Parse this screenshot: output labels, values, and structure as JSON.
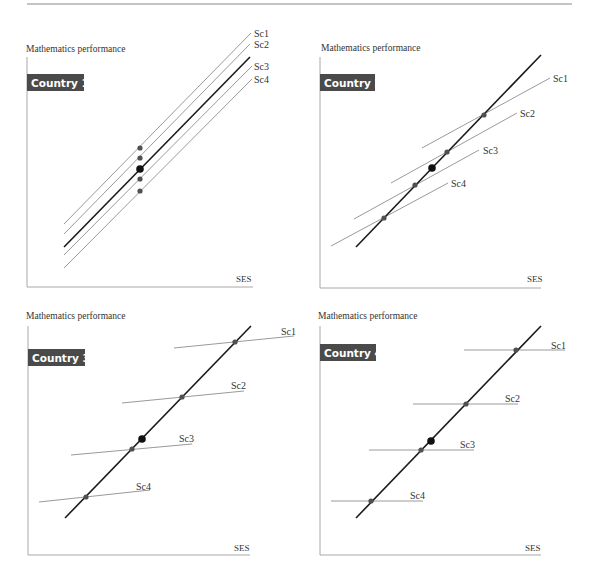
{
  "figure": {
    "top_rule": {
      "x1": 27,
      "x2": 572,
      "y": 4
    },
    "colors": {
      "axis": "#a8a8a8",
      "thin_line": "#9a9a9a",
      "thick_line": "#1a1a1a",
      "dot_small": "#505050",
      "dot_large": "#111111",
      "badge_bg": "#4a4a4a",
      "badge_text": "#ffffff"
    }
  },
  "chart_data": [
    {
      "type": "line",
      "title": "Country 1",
      "ylabel": "Mathematics performance",
      "xlabel": "SES",
      "legend": [
        "Sc1",
        "Sc2",
        "Sc3",
        "Sc4"
      ],
      "description": "Four parallel school lines, all with the same slope as the overall country gradient; school means differ only in level.",
      "series": [
        {
          "name": "Sc1",
          "slope_rel": "equal",
          "x": [
            64,
            251
          ],
          "y": [
            224,
            33
          ]
        },
        {
          "name": "Sc2",
          "slope_rel": "equal",
          "x": [
            64,
            250
          ],
          "y": [
            234,
            44
          ]
        },
        {
          "name": "Overall",
          "slope_rel": "equal",
          "x": [
            64,
            250
          ],
          "y": [
            247,
            57
          ]
        },
        {
          "name": "Sc3",
          "slope_rel": "equal",
          "x": [
            64,
            252
          ],
          "y": [
            255,
            66
          ]
        },
        {
          "name": "Sc4",
          "slope_rel": "equal",
          "x": [
            64,
            252
          ],
          "y": [
            268,
            79
          ]
        }
      ]
    },
    {
      "type": "line",
      "title": "Country 2",
      "ylabel": "Mathematics performance",
      "xlabel": "SES",
      "legend": [
        "Sc1",
        "Sc2",
        "Sc3",
        "Sc4"
      ],
      "description": "School lines have moderately shallower slopes than the steep overall gradient.",
      "series": [
        {
          "name": "Overall",
          "x": [
            356,
            541
          ],
          "y": [
            247,
            55
          ]
        },
        {
          "name": "Sc1",
          "x": [
            422,
            550
          ],
          "y": [
            148,
            78
          ]
        },
        {
          "name": "Sc2",
          "x": [
            391,
            517
          ],
          "y": [
            183,
            113
          ]
        },
        {
          "name": "Sc3",
          "x": [
            354,
            479
          ],
          "y": [
            219,
            150
          ]
        },
        {
          "name": "Sc4",
          "x": [
            331,
            448
          ],
          "y": [
            246,
            183
          ]
        }
      ]
    },
    {
      "type": "line",
      "title": "Country 3",
      "ylabel": "Mathematics performance",
      "xlabel": "SES",
      "legend": [
        "Sc1",
        "Sc2",
        "Sc3",
        "Sc4"
      ],
      "description": "School lines are nearly flat; between-school gradient is steep.",
      "series": [
        {
          "name": "Overall",
          "x": [
            65,
            251
          ],
          "y": [
            518,
            326
          ]
        },
        {
          "name": "Sc1",
          "x": [
            174,
            294
          ],
          "y": [
            348,
            336
          ]
        },
        {
          "name": "Sc2",
          "x": [
            122,
            244
          ],
          "y": [
            403,
            391
          ]
        },
        {
          "name": "Sc3",
          "x": [
            71,
            192
          ],
          "y": [
            455,
            444
          ]
        },
        {
          "name": "Sc4",
          "x": [
            39,
            150
          ],
          "y": [
            502,
            490
          ]
        }
      ]
    },
    {
      "type": "line",
      "title": "Country 4",
      "ylabel": "Mathematics performance",
      "xlabel": "SES",
      "legend": [
        "Sc1",
        "Sc2",
        "Sc3",
        "Sc4"
      ],
      "description": "School lines are completely flat (zero within-school gradient).",
      "series": [
        {
          "name": "Overall",
          "x": [
            356,
            541
          ],
          "y": [
            518,
            326
          ]
        },
        {
          "name": "Sc1",
          "x": [
            464,
            565
          ],
          "y": [
            350,
            350
          ]
        },
        {
          "name": "Sc2",
          "x": [
            413,
            518
          ],
          "y": [
            404,
            404
          ]
        },
        {
          "name": "Sc3",
          "x": [
            369,
            474
          ],
          "y": [
            450,
            450
          ]
        },
        {
          "name": "Sc4",
          "x": [
            331,
            423
          ],
          "y": [
            501,
            501
          ]
        }
      ]
    }
  ],
  "panels": [
    {
      "id": "country-1",
      "title": "Country 1",
      "ylabel": "Mathematics performance",
      "xlabel": "SES",
      "ylabel_pos": [
        26,
        52
      ],
      "axis": {
        "x0": 27,
        "ytop": 57,
        "ybottom": 287,
        "xright": 253
      },
      "xlabel_pos": [
        236,
        282
      ],
      "badge": {
        "x": 27,
        "y": 74,
        "w": 57,
        "h": 17
      },
      "thick": {
        "x1": 64,
        "y1": 247,
        "x2": 250,
        "y2": 57
      },
      "lines": [
        {
          "label": "Sc1",
          "x1": 64,
          "y1": 224,
          "x2": 251,
          "y2": 33,
          "lx": 254,
          "ly": 37
        },
        {
          "label": "Sc2",
          "x1": 64,
          "y1": 234,
          "x2": 250,
          "y2": 44,
          "lx": 254,
          "ly": 48
        },
        {
          "label": "Sc3",
          "x1": 64,
          "y1": 255,
          "x2": 252,
          "y2": 66,
          "lx": 254,
          "ly": 70
        },
        {
          "label": "Sc4",
          "x1": 64,
          "y1": 268,
          "x2": 252,
          "y2": 79,
          "lx": 254,
          "ly": 83
        }
      ],
      "dots": [
        {
          "x": 140,
          "y": 148
        },
        {
          "x": 140,
          "y": 158
        },
        {
          "x": 140,
          "y": 179
        },
        {
          "x": 140,
          "y": 191
        }
      ],
      "big_dot": {
        "x": 140,
        "y": 169
      }
    },
    {
      "id": "country-2",
      "title": "Country 2",
      "ylabel": "Mathematics performance",
      "xlabel": "SES",
      "ylabel_pos": [
        321,
        51
      ],
      "axis": {
        "x0": 320,
        "ytop": 57,
        "ybottom": 288,
        "xright": 541
      },
      "xlabel_pos": [
        527,
        282
      ],
      "badge": {
        "x": 320,
        "y": 74,
        "w": 55,
        "h": 17
      },
      "thick": {
        "x1": 356,
        "y1": 247,
        "x2": 541,
        "y2": 55
      },
      "lines": [
        {
          "label": "Sc1",
          "x1": 422,
          "y1": 148,
          "x2": 550,
          "y2": 78,
          "lx": 553,
          "ly": 82
        },
        {
          "label": "Sc2",
          "x1": 391,
          "y1": 183,
          "x2": 517,
          "y2": 113,
          "lx": 520,
          "ly": 117
        },
        {
          "label": "Sc3",
          "x1": 354,
          "y1": 219,
          "x2": 479,
          "y2": 150,
          "lx": 483,
          "ly": 154
        },
        {
          "label": "Sc4",
          "x1": 331,
          "y1": 246,
          "x2": 448,
          "y2": 183,
          "lx": 451,
          "ly": 187
        }
      ],
      "dots": [
        {
          "x": 484,
          "y": 115
        },
        {
          "x": 447,
          "y": 152
        },
        {
          "x": 415,
          "y": 185
        },
        {
          "x": 384,
          "y": 218
        }
      ],
      "big_dot": {
        "x": 432,
        "y": 168
      }
    },
    {
      "id": "country-3",
      "title": "Country 3",
      "ylabel": "Mathematics performance",
      "xlabel": "SES",
      "ylabel_pos": [
        26,
        319
      ],
      "axis": {
        "x0": 28,
        "ytop": 326,
        "ybottom": 555,
        "xright": 250
      },
      "xlabel_pos": [
        234,
        551
      ],
      "badge": {
        "x": 28,
        "y": 349,
        "w": 57,
        "h": 17
      },
      "thick": {
        "x1": 65,
        "y1": 518,
        "x2": 251,
        "y2": 326
      },
      "lines": [
        {
          "label": "Sc1",
          "x1": 174,
          "y1": 348,
          "x2": 294,
          "y2": 336,
          "lx": 281,
          "ly": 335
        },
        {
          "label": "Sc2",
          "x1": 122,
          "y1": 403,
          "x2": 244,
          "y2": 391,
          "lx": 231,
          "ly": 389
        },
        {
          "label": "Sc3",
          "x1": 71,
          "y1": 455,
          "x2": 192,
          "y2": 444,
          "lx": 179,
          "ly": 442
        },
        {
          "label": "Sc4",
          "x1": 39,
          "y1": 502,
          "x2": 150,
          "y2": 490,
          "lx": 136,
          "ly": 490
        }
      ],
      "dots": [
        {
          "x": 235,
          "y": 342
        },
        {
          "x": 182,
          "y": 397
        },
        {
          "x": 132,
          "y": 449
        },
        {
          "x": 86,
          "y": 497
        }
      ],
      "big_dot": {
        "x": 142,
        "y": 439
      }
    },
    {
      "id": "country-4",
      "title": "Country 4",
      "ylabel": "Mathematics performance",
      "xlabel": "SES",
      "ylabel_pos": [
        318,
        319
      ],
      "axis": {
        "x0": 320,
        "ytop": 326,
        "ybottom": 555,
        "xright": 541
      },
      "xlabel_pos": [
        525,
        551
      ],
      "badge": {
        "x": 320,
        "y": 344,
        "w": 56,
        "h": 17
      },
      "thick": {
        "x1": 356,
        "y1": 518,
        "x2": 541,
        "y2": 326
      },
      "lines": [
        {
          "label": "Sc1",
          "x1": 464,
          "y1": 350,
          "x2": 565,
          "y2": 350,
          "lx": 551,
          "ly": 349
        },
        {
          "label": "Sc2",
          "x1": 413,
          "y1": 404,
          "x2": 518,
          "y2": 404,
          "lx": 505,
          "ly": 402
        },
        {
          "label": "Sc3",
          "x1": 369,
          "y1": 450,
          "x2": 474,
          "y2": 450,
          "lx": 460,
          "ly": 448
        },
        {
          "label": "Sc4",
          "x1": 331,
          "y1": 501,
          "x2": 423,
          "y2": 501,
          "lx": 410,
          "ly": 499
        }
      ],
      "dots": [
        {
          "x": 516,
          "y": 350
        },
        {
          "x": 466,
          "y": 404
        },
        {
          "x": 421,
          "y": 450
        },
        {
          "x": 371,
          "y": 501
        }
      ],
      "big_dot": {
        "x": 431,
        "y": 441
      }
    }
  ]
}
